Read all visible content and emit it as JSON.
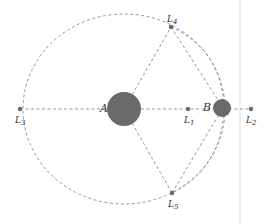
{
  "diagram": {
    "colors": {
      "body": "#6a6a6a",
      "point": "#6a6a6a",
      "line": "#8a8a8a",
      "edge": "#eeeeee"
    },
    "bodies": [
      {
        "id": "A",
        "label": "A",
        "cx": 124,
        "cy": 109,
        "r": 17
      },
      {
        "id": "B",
        "label": "B",
        "cx": 222,
        "cy": 108,
        "r": 9
      }
    ],
    "points": [
      {
        "id": "L1",
        "label": "L",
        "sub": "1",
        "cx": 188,
        "cy": 109
      },
      {
        "id": "L2",
        "label": "L",
        "sub": "2",
        "cx": 251,
        "cy": 109
      },
      {
        "id": "L3",
        "label": "L",
        "sub": "3",
        "cx": 20,
        "cy": 109
      },
      {
        "id": "L4",
        "label": "L",
        "sub": "4",
        "cx": 171,
        "cy": 27
      },
      {
        "id": "L5",
        "label": "L",
        "sub": "5",
        "cx": 172,
        "cy": 193
      }
    ],
    "orbit": {
      "cx": 124,
      "cy": 109,
      "rx": 101,
      "ry": 95
    }
  }
}
